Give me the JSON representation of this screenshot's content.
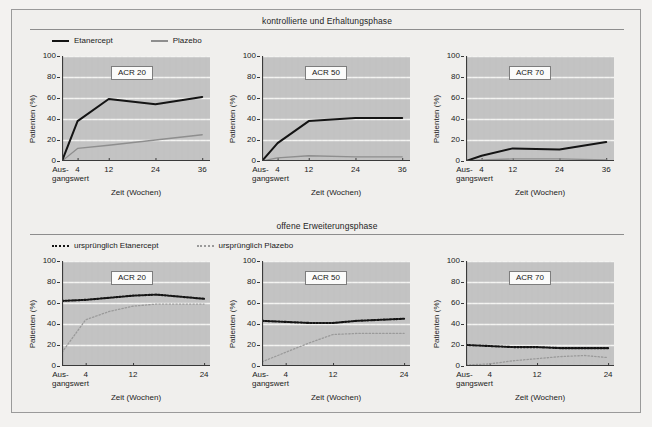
{
  "figure": {
    "y_axis_label": "Patienten (%)",
    "x_axis_label": "Zeit (Wochen)",
    "baseline_line1": "Aus-",
    "baseline_line2": "gangswert",
    "y_ticks": [
      "0",
      "20",
      "40",
      "60",
      "80",
      "100"
    ],
    "colors": {
      "page_background": "#f3f2f0",
      "frame_border": "#9a9a9a",
      "plot_fill": "#c3c3c3",
      "gridline": "#f4f4f2",
      "etanercept_line": "#141414",
      "plazebo_line": "#8e8e8e",
      "axis": "#3a3a3a",
      "rule": "#8d8d8d"
    }
  },
  "sections": [
    {
      "id": "controlled",
      "title": "kontrollierte und Erhaltungsphase",
      "legend": [
        {
          "label": "Etanercept",
          "style": "solid-dark"
        },
        {
          "label": "Plazebo",
          "style": "solid-gray"
        }
      ],
      "x_ticks": [
        "4",
        "12",
        "24",
        "36"
      ],
      "x_tick_values": [
        4,
        12,
        24,
        36
      ],
      "x_max": 38,
      "panels": [
        {
          "label": "ACR 20"
        },
        {
          "label": "ACR 50"
        },
        {
          "label": "ACR 70"
        }
      ]
    },
    {
      "id": "openlabel",
      "title": "offene Erweiterungsphase",
      "legend": [
        {
          "label": "ursprünglich Etanercept",
          "style": "dot-dark"
        },
        {
          "label": "ursprünglich Plazebo",
          "style": "dot-gray"
        }
      ],
      "x_ticks": [
        "4",
        "12",
        "24"
      ],
      "x_tick_values": [
        4,
        12,
        24
      ],
      "x_max": 25,
      "panels": [
        {
          "label": "ACR 20"
        },
        {
          "label": "ACR 50"
        },
        {
          "label": "ACR 70"
        }
      ]
    }
  ],
  "chart_data": [
    {
      "type": "line",
      "title": "ACR 20",
      "subtitle": "kontrollierte und Erhaltungsphase",
      "xlabel": "Zeit (Wochen)",
      "ylabel": "Patienten (%)",
      "ylim": [
        0,
        100
      ],
      "xlim": [
        0,
        38
      ],
      "grid": true,
      "legend_position": "above-figure",
      "x": [
        0,
        4,
        12,
        24,
        36
      ],
      "series": [
        {
          "name": "Etanercept",
          "style": "solid",
          "color": "#141414",
          "values": [
            0,
            38,
            59,
            54,
            61
          ]
        },
        {
          "name": "Plazebo",
          "style": "solid",
          "color": "#8e8e8e",
          "values": [
            0,
            12,
            15,
            20,
            25
          ]
        }
      ]
    },
    {
      "type": "line",
      "title": "ACR 50",
      "subtitle": "kontrollierte und Erhaltungsphase",
      "xlabel": "Zeit (Wochen)",
      "ylabel": "Patienten (%)",
      "ylim": [
        0,
        100
      ],
      "xlim": [
        0,
        38
      ],
      "grid": true,
      "legend_position": "above-figure",
      "x": [
        0,
        4,
        12,
        24,
        36
      ],
      "series": [
        {
          "name": "Etanercept",
          "style": "solid",
          "color": "#141414",
          "values": [
            0,
            17,
            38,
            41,
            41
          ]
        },
        {
          "name": "Plazebo",
          "style": "solid",
          "color": "#8e8e8e",
          "values": [
            0,
            3,
            5,
            4,
            4
          ]
        }
      ]
    },
    {
      "type": "line",
      "title": "ACR 70",
      "subtitle": "kontrollierte und Erhaltungsphase",
      "xlabel": "Zeit (Wochen)",
      "ylabel": "Patienten (%)",
      "ylim": [
        0,
        100
      ],
      "xlim": [
        0,
        38
      ],
      "grid": true,
      "legend_position": "above-figure",
      "x": [
        0,
        4,
        12,
        24,
        36
      ],
      "series": [
        {
          "name": "Etanercept",
          "style": "solid",
          "color": "#141414",
          "values": [
            0,
            5,
            12,
            11,
            18
          ]
        },
        {
          "name": "Plazebo",
          "style": "solid",
          "color": "#8e8e8e",
          "values": [
            0,
            1,
            2,
            2,
            1
          ]
        }
      ]
    },
    {
      "type": "line",
      "title": "ACR 20",
      "subtitle": "offene Erweiterungsphase",
      "xlabel": "Zeit (Wochen)",
      "ylabel": "Patienten (%)",
      "ylim": [
        0,
        100
      ],
      "xlim": [
        0,
        25
      ],
      "grid": true,
      "legend_position": "above-figure",
      "x": [
        0,
        4,
        8,
        12,
        16,
        20,
        24
      ],
      "series": [
        {
          "name": "ursprünglich Etanercept",
          "style": "dotted",
          "color": "#141414",
          "values": [
            62,
            63,
            65,
            67,
            68,
            66,
            64
          ]
        },
        {
          "name": "ursprünglich Plazebo",
          "style": "dotted",
          "color": "#9a9a9a",
          "values": [
            13,
            44,
            52,
            57,
            59,
            59,
            59
          ]
        }
      ]
    },
    {
      "type": "line",
      "title": "ACR 50",
      "subtitle": "offene Erweiterungsphase",
      "xlabel": "Zeit (Wochen)",
      "ylabel": "Patienten (%)",
      "ylim": [
        0,
        100
      ],
      "xlim": [
        0,
        25
      ],
      "grid": true,
      "legend_position": "above-figure",
      "x": [
        0,
        4,
        8,
        12,
        16,
        20,
        24
      ],
      "series": [
        {
          "name": "ursprünglich Etanercept",
          "style": "dotted",
          "color": "#141414",
          "values": [
            43,
            42,
            41,
            41,
            43,
            44,
            45
          ]
        },
        {
          "name": "ursprünglich Plazebo",
          "style": "dotted",
          "color": "#9a9a9a",
          "values": [
            4,
            13,
            22,
            30,
            31,
            31,
            31
          ]
        }
      ]
    },
    {
      "type": "line",
      "title": "ACR 70",
      "subtitle": "offene Erweiterungsphase",
      "xlabel": "Zeit (Wochen)",
      "ylabel": "Patienten (%)",
      "ylim": [
        0,
        100
      ],
      "xlim": [
        0,
        25
      ],
      "grid": true,
      "legend_position": "above-figure",
      "x": [
        0,
        4,
        8,
        12,
        16,
        20,
        24
      ],
      "series": [
        {
          "name": "ursprünglich Etanercept",
          "style": "dotted",
          "color": "#141414",
          "values": [
            20,
            19,
            18,
            18,
            17,
            17,
            17
          ]
        },
        {
          "name": "ursprünglich Plazebo",
          "style": "dotted",
          "color": "#9a9a9a",
          "values": [
            1,
            2,
            5,
            7,
            9,
            10,
            8
          ]
        }
      ]
    }
  ]
}
